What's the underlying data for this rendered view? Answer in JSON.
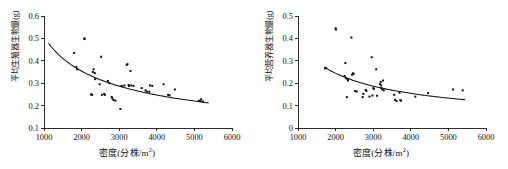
{
  "figure": {
    "background": "#ffffff",
    "marker_color": "#101010",
    "curve_color": "#111111",
    "axis_color": "#141414"
  },
  "panels": [
    {
      "id": "left",
      "name": "reproductive-biomass-panel",
      "chart_data": {
        "type": "scatter",
        "title": "",
        "xlabel": "密度(分株/m2)",
        "xlabel_base": "密度(分株/m",
        "xlabel_sup": "2",
        "xlabel_tail": ")",
        "ylabel": "平均生殖器生物量(g)",
        "xlim": [
          1000,
          6000
        ],
        "ylim": [
          0.1,
          0.6
        ],
        "xticks": [
          1000,
          2000,
          3000,
          4000,
          5000,
          6000
        ],
        "xticklabels": [
          "1000",
          "2000",
          "3000",
          "4000",
          "5000",
          "6000"
        ],
        "yticks": [
          0.1,
          0.2,
          0.3,
          0.4,
          0.5,
          0.6
        ],
        "yticklabels": [
          "0.1",
          "0.2",
          "0.3",
          "0.4",
          "0.5",
          "0.6"
        ],
        "grid": false,
        "legend": false,
        "points": [
          [
            1800,
            0.435
          ],
          [
            1860,
            0.372
          ],
          [
            1880,
            0.362
          ],
          [
            2070,
            0.5
          ],
          [
            2080,
            0.497
          ],
          [
            2250,
            0.25
          ],
          [
            2280,
            0.248
          ],
          [
            2300,
            0.35
          ],
          [
            2320,
            0.362
          ],
          [
            2350,
            0.345
          ],
          [
            2360,
            0.318
          ],
          [
            2480,
            0.295
          ],
          [
            2520,
            0.418
          ],
          [
            2540,
            0.248
          ],
          [
            2600,
            0.252
          ],
          [
            2620,
            0.248
          ],
          [
            2700,
            0.31
          ],
          [
            2740,
            0.3
          ],
          [
            2800,
            0.238
          ],
          [
            2820,
            0.232
          ],
          [
            2850,
            0.225
          ],
          [
            2900,
            0.222
          ],
          [
            3030,
            0.185
          ],
          [
            3060,
            0.288
          ],
          [
            3080,
            0.286
          ],
          [
            3140,
            0.29
          ],
          [
            3200,
            0.382
          ],
          [
            3220,
            0.385
          ],
          [
            3250,
            0.292
          ],
          [
            3260,
            0.288
          ],
          [
            3300,
            0.355
          ],
          [
            3320,
            0.29
          ],
          [
            3380,
            0.288
          ],
          [
            3600,
            0.278
          ],
          [
            3700,
            0.268
          ],
          [
            3740,
            0.262
          ],
          [
            3800,
            0.262
          ],
          [
            3820,
            0.29
          ],
          [
            3880,
            0.288
          ],
          [
            4180,
            0.295
          ],
          [
            4300,
            0.248
          ],
          [
            4340,
            0.246
          ],
          [
            4480,
            0.272
          ],
          [
            5120,
            0.222
          ],
          [
            5160,
            0.22
          ],
          [
            5180,
            0.228
          ],
          [
            5230,
            0.218
          ]
        ],
        "fit_curve": {
          "label": "fitted-decreasing-curve",
          "x_start": 1120,
          "x_end": 5380,
          "y_start": 0.478,
          "y_end": 0.212,
          "form": "power-decay"
        }
      }
    },
    {
      "id": "right",
      "name": "vegetative-biomass-panel",
      "chart_data": {
        "type": "scatter",
        "title": "",
        "xlabel": "密度(分株/m2)",
        "xlabel_base": "密度(分株/m",
        "xlabel_sup": "2",
        "xlabel_tail": ")",
        "ylabel": "平均营养器生物量(g)",
        "xlim": [
          1000,
          6000
        ],
        "ylim": [
          0,
          0.5
        ],
        "xticks": [
          1000,
          2000,
          3000,
          4000,
          5000,
          6000
        ],
        "xticklabels": [
          "1000",
          "2000",
          "3000",
          "4000",
          "5000",
          "6000"
        ],
        "yticks": [
          0,
          0.1,
          0.2,
          0.3,
          0.4,
          0.5
        ],
        "yticklabels": [
          "0",
          "0.1",
          "0.2",
          "0.3",
          "0.4",
          "0.5"
        ],
        "grid": false,
        "legend": false,
        "points": [
          [
            1720,
            0.266
          ],
          [
            1740,
            0.268
          ],
          [
            2000,
            0.445
          ],
          [
            2010,
            0.44
          ],
          [
            2240,
            0.232
          ],
          [
            2260,
            0.29
          ],
          [
            2280,
            0.222
          ],
          [
            2300,
            0.138
          ],
          [
            2320,
            0.218
          ],
          [
            2330,
            0.212
          ],
          [
            2420,
            0.404
          ],
          [
            2440,
            0.238
          ],
          [
            2460,
            0.244
          ],
          [
            2480,
            0.242
          ],
          [
            2520,
            0.165
          ],
          [
            2560,
            0.163
          ],
          [
            2720,
            0.138
          ],
          [
            2740,
            0.152
          ],
          [
            2800,
            0.17
          ],
          [
            2820,
            0.166
          ],
          [
            2900,
            0.14
          ],
          [
            2960,
            0.316
          ],
          [
            2980,
            0.145
          ],
          [
            3000,
            0.178
          ],
          [
            3020,
            0.175
          ],
          [
            3080,
            0.262
          ],
          [
            3100,
            0.144
          ],
          [
            3180,
            0.196
          ],
          [
            3200,
            0.206
          ],
          [
            3210,
            0.19
          ],
          [
            3220,
            0.178
          ],
          [
            3240,
            0.172
          ],
          [
            3260,
            0.212
          ],
          [
            3280,
            0.168
          ],
          [
            3560,
            0.148
          ],
          [
            3580,
            0.126
          ],
          [
            3620,
            0.12
          ],
          [
            3700,
            0.158
          ],
          [
            3720,
            0.124
          ],
          [
            3740,
            0.122
          ],
          [
            4120,
            0.14
          ],
          [
            4460,
            0.156
          ],
          [
            5120,
            0.172
          ],
          [
            5380,
            0.168
          ]
        ],
        "fit_curve": {
          "label": "fitted-decreasing-curve",
          "x_start": 1700,
          "x_end": 5450,
          "y_start": 0.272,
          "y_end": 0.126,
          "form": "power-decay"
        }
      }
    }
  ]
}
